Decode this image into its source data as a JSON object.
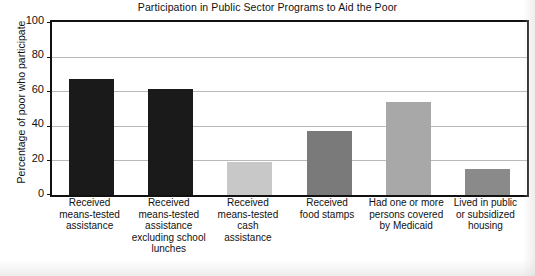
{
  "chart_data": {
    "type": "bar",
    "title": "Participation in Public Sector Programs to Aid the Poor",
    "xlabel": "",
    "ylabel": "Percentage of poor who participate",
    "ylim": [
      0,
      100
    ],
    "yticks": [
      0,
      20,
      40,
      60,
      80,
      100
    ],
    "grid": true,
    "legend": "none",
    "categories": [
      "Received\nmeans-tested\nassistance",
      "Received\nmeans-tested\nassistance\nexcluding school\nlunches",
      "Received\nmeans-tested\ncash\nassistance",
      "Received\nfood stamps",
      "Had one or more\npersons covered\nby Medicaid",
      "Lived in public\nor subsidized\nhousing"
    ],
    "values": [
      67,
      61,
      19,
      37,
      54,
      15
    ],
    "bar_colors": [
      "#1a1a1a",
      "#1a1a1a",
      "#c8c8c8",
      "#7a7a7a",
      "#a8a8a8",
      "#8a8a8a"
    ]
  },
  "axis": {
    "tick_labels": [
      "100",
      "80",
      "60",
      "40",
      "20",
      "0"
    ]
  },
  "colors": {
    "frame": "#111111",
    "gridline": "#b9b9b9",
    "background": "#ffffff",
    "text": "#111111"
  }
}
